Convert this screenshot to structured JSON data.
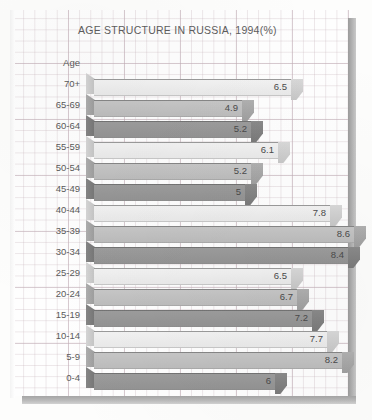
{
  "chart_data": {
    "type": "bar",
    "orientation": "horizontal",
    "title": "AGE STRUCTURE IN RUSSIA, 1994(%)",
    "axis_title": "Age",
    "xlabel": "",
    "ylabel": "Age",
    "grid": true,
    "legend": "none",
    "xlim": [
      0,
      8.6
    ],
    "categories": [
      "70+",
      "65-69",
      "60-64",
      "55-59",
      "50-54",
      "45-49",
      "40-44",
      "35-39",
      "30-34",
      "25-29",
      "20-24",
      "15-19",
      "10-14",
      "5-9",
      "0-4"
    ],
    "values": [
      6.5,
      4.9,
      5.2,
      6.1,
      5.2,
      5,
      7.8,
      8.6,
      8.4,
      6.5,
      6.7,
      7.2,
      7.7,
      8.2,
      6
    ],
    "value_labels": [
      "6.5",
      "4.9",
      "5.2",
      "6.1",
      "5.2",
      "5",
      "7.8",
      "8.6",
      "8.4",
      "6.5",
      "6.7",
      "7.2",
      "7.7",
      "8.2",
      "6"
    ],
    "rows": [
      {
        "label": "70+",
        "value": 6.5,
        "text": "6.5",
        "tone": 0
      },
      {
        "label": "65-69",
        "value": 4.9,
        "text": "4.9",
        "tone": 1
      },
      {
        "label": "60-64",
        "value": 5.2,
        "text": "5.2",
        "tone": 2
      },
      {
        "label": "55-59",
        "value": 6.1,
        "text": "6.1",
        "tone": 0
      },
      {
        "label": "50-54",
        "value": 5.2,
        "text": "5.2",
        "tone": 1
      },
      {
        "label": "45-49",
        "value": 5,
        "text": "5",
        "tone": 2
      },
      {
        "label": "40-44",
        "value": 7.8,
        "text": "7.8",
        "tone": 0
      },
      {
        "label": "35-39",
        "value": 8.6,
        "text": "8.6",
        "tone": 1
      },
      {
        "label": "30-34",
        "value": 8.4,
        "text": "8.4",
        "tone": 2
      },
      {
        "label": "25-29",
        "value": 6.5,
        "text": "6.5",
        "tone": 0
      },
      {
        "label": "20-24",
        "value": 6.7,
        "text": "6.7",
        "tone": 1
      },
      {
        "label": "15-19",
        "value": 7.2,
        "text": "7.2",
        "tone": 2
      },
      {
        "label": "10-14",
        "value": 7.7,
        "text": "7.7",
        "tone": 0
      },
      {
        "label": "5-9",
        "value": 8.2,
        "text": "8.2",
        "tone": 1
      },
      {
        "label": "0-4",
        "value": 6,
        "text": "6",
        "tone": 2
      }
    ]
  },
  "colors": {
    "tone_light": "#f2f2f2",
    "tone_mid": "#c6c6c6",
    "tone_dark": "#9c9c9c",
    "grid_line": "#bca6b0",
    "frame": "#b4b4b4",
    "text": "#5a5a5a",
    "paper": "#fefefe"
  }
}
